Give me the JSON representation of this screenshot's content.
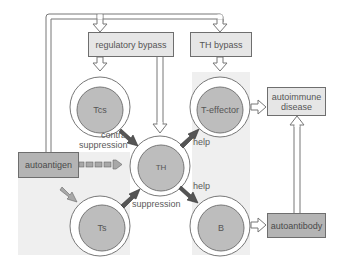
{
  "boxes": {
    "regulatory_bypass": "regulatory bypass",
    "th_bypass": "TH bypass",
    "autoantigen": "autoantigen",
    "autoimmune_disease_line1": "autoimmune",
    "autoimmune_disease_line2": "disease",
    "autoantibody": "autoantibody"
  },
  "cells": {
    "tcs": "Tcs",
    "t_effector": "T-effector",
    "th": "TH",
    "ts": "Ts",
    "b": "B"
  },
  "edge_labels": {
    "contra_line1": "contra",
    "contra_line2": "suppression",
    "suppression": "suppression",
    "help_upper": "help",
    "help_lower": "help"
  },
  "colors": {
    "cell_fill": "#bdbdbd",
    "box_light": "#e6e6e6",
    "box_dark": "#b4b4b4",
    "shade": "#efefef",
    "arrow_dark": "#555555",
    "arrow_light": "#a8a8a8"
  }
}
